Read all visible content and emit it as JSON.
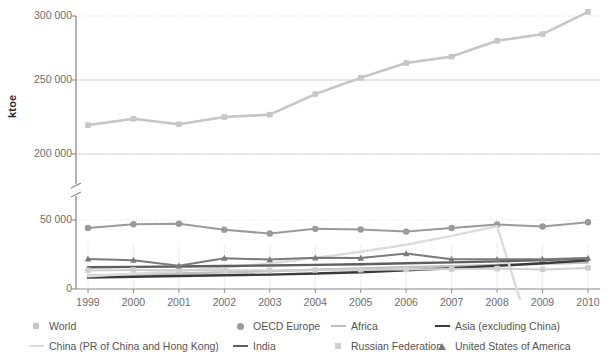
{
  "chart_data": {
    "type": "line",
    "title": "",
    "xlabel": "",
    "ylabel": "ktoe",
    "x": [
      1999,
      2000,
      2001,
      2002,
      2003,
      2004,
      2005,
      2006,
      2007,
      2008,
      2009,
      2010
    ],
    "x_tick_labels": [
      "1999",
      "2000",
      "2001",
      "2002",
      "2003",
      "2004",
      "2005",
      "2006",
      "2007",
      "2008",
      "2009",
      "2010"
    ],
    "y_tick_labels": [
      "0",
      "50 000",
      "200 000",
      "250 000",
      "300 000"
    ],
    "y_axis_break": true,
    "y_lower_range": [
      0,
      50000
    ],
    "y_upper_range": [
      200000,
      300000
    ],
    "grid": true,
    "legend_position": "bottom",
    "series": [
      {
        "name": "World",
        "marker": "square",
        "color": "#c6c6c6",
        "values": [
          219500,
          223800,
          220100,
          225000,
          226600,
          240500,
          251500,
          261500,
          265800,
          276500,
          281000,
          296000
        ]
      },
      {
        "name": "OECD Europe",
        "marker": "circle",
        "color": "#9a9a9a",
        "values": [
          44200,
          46900,
          47300,
          42900,
          40200,
          43600,
          43100,
          41600,
          44200,
          46800,
          45300,
          48400
        ]
      },
      {
        "name": "Africa",
        "marker": "line",
        "color": "#bfbfbf",
        "values": [
          9800,
          10500,
          11200,
          12100,
          13000,
          13900,
          14900,
          15800,
          16600,
          17500,
          18300,
          19200
        ]
      },
      {
        "name": "Asia (excluding China)",
        "marker": "line",
        "color": "#3a3a3a",
        "values": [
          8300,
          8900,
          9400,
          9900,
          10400,
          11200,
          12200,
          13500,
          15100,
          16800,
          18600,
          20700
        ]
      },
      {
        "name": "China (PR of China and Hong Kong)",
        "marker": "line",
        "color": "#dcdcdc",
        "values": [
          9200,
          11000,
          13000,
          15500,
          18500,
          22500,
          27000,
          32000,
          38500,
          45500,
          53000,
          61000
        ]
      },
      {
        "name": "India",
        "marker": "line",
        "color": "#5f5f5f",
        "values": [
          15800,
          16000,
          16300,
          16700,
          17000,
          17500,
          18000,
          18600,
          19300,
          20000,
          21000,
          22000
        ]
      },
      {
        "name": "Russian Federation",
        "marker": "square",
        "color": "#cfcfcf",
        "values": [
          13500,
          13800,
          13700,
          13600,
          13500,
          13800,
          14000,
          14200,
          14500,
          14800,
          14200,
          15300
        ]
      },
      {
        "name": "United States of America",
        "marker": "triangle",
        "color": "#7a7a7a",
        "values": [
          21800,
          20900,
          16800,
          22300,
          21300,
          22600,
          22400,
          25700,
          21600,
          21500,
          21600,
          22400
        ]
      }
    ]
  },
  "legend": {
    "items": [
      {
        "label": "World",
        "marker": "square",
        "color": "#c6c6c6"
      },
      {
        "label": "OECD Europe",
        "marker": "circle",
        "color": "#9a9a9a"
      },
      {
        "label": "Africa",
        "marker": "line",
        "color": "#bfbfbf"
      },
      {
        "label": "Asia (excluding China)",
        "marker": "line",
        "color": "#3a3a3a"
      },
      {
        "label": "China (PR of China and Hong Kong)",
        "marker": "line",
        "color": "#dcdcdc"
      },
      {
        "label": "India",
        "marker": "line",
        "color": "#5f5f5f"
      },
      {
        "label": "Russian Federation",
        "marker": "square",
        "color": "#cfcfcf"
      },
      {
        "label": "United States of America",
        "marker": "triangle",
        "color": "#7a7a7a"
      }
    ]
  },
  "style": {
    "grid_color": "#d8d8d8",
    "axis_color": "#8a8a8a",
    "text_color": "#6d6d6d"
  }
}
